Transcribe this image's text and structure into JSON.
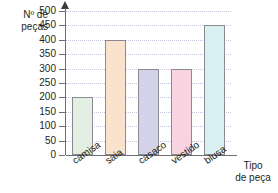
{
  "chart_data": {
    "type": "bar",
    "title": "",
    "subtitle": "",
    "ylabel": "Nº de\npeças",
    "xlabel": "Tipo\nde peça",
    "categories": [
      "camisa",
      "saia",
      "casaco",
      "vestido",
      "blusa"
    ],
    "values": [
      200,
      400,
      300,
      300,
      450
    ],
    "ylim": [
      0,
      500
    ],
    "ytick_step": 50,
    "yticks": [
      0,
      50,
      100,
      150,
      200,
      250,
      300,
      350,
      400,
      450,
      500
    ],
    "ytick_labels": [
      "0",
      "50",
      "100",
      "150",
      "200",
      "250",
      "300",
      "350",
      "400",
      "450",
      "500"
    ],
    "grid": true,
    "grid_color": "#c9c5dd",
    "legend": false,
    "legend_position": "none",
    "bar_colors": [
      "#e3efe2",
      "#fae3cc",
      "#d2d2e8",
      "#f7d4df",
      "#d8f0f2"
    ],
    "bar_edge_color": "#8a8a93",
    "axis_color": "#6d6e71",
    "text_color": "#231f20",
    "background": "#ffffff",
    "xtick_rotation": -35
  }
}
